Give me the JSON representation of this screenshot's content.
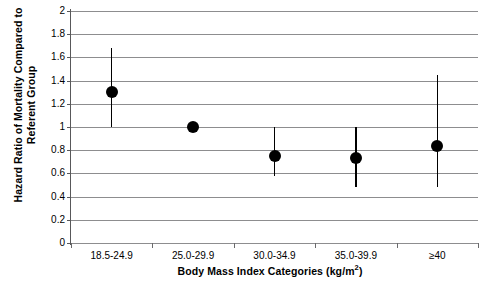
{
  "chart_data": {
    "type": "scatter",
    "title": "",
    "xlabel": "Body Mass Index Categories (kg/m2)",
    "xlabel_main": "Body Mass Index Categories (kg/m",
    "xlabel_sup": "2",
    "xlabel_tail": ")",
    "ylabel": "Hazard Ratio of Mortality Compared to Referent Group",
    "ylabel_line1": "Hazard Ratio of Mortality Compared to",
    "ylabel_line2": "Referent Group",
    "categories": [
      "18.5-24.9",
      "25.0-29.9",
      "30.0-34.9",
      "35.0-39.9",
      "≥40"
    ],
    "values": [
      1.3,
      1.0,
      0.75,
      0.73,
      0.84
    ],
    "ci_low": [
      1.0,
      null,
      0.58,
      0.48,
      0.48
    ],
    "ci_high": [
      1.68,
      null,
      1.0,
      1.0,
      1.45
    ],
    "referent_category": "25.0-29.9",
    "ylim": [
      0,
      2
    ],
    "ytick_step": 0.2,
    "ytick_labels": [
      "0",
      "0.2",
      "0.4",
      "0.6",
      "0.8",
      "1",
      "1.2",
      "1.4",
      "1.6",
      "1.8",
      "2"
    ],
    "ytick_values": [
      0,
      0.2,
      0.4,
      0.6,
      0.8,
      1,
      1.2,
      1.4,
      1.6,
      1.8,
      2
    ],
    "grid": true,
    "grid_orientation": "horizontal",
    "legend": "none",
    "marker_color": "#000000",
    "grid_color": "#8d8d8f",
    "axis_color": "#58585a",
    "error_bar_style": "plain-line-no-caps"
  }
}
